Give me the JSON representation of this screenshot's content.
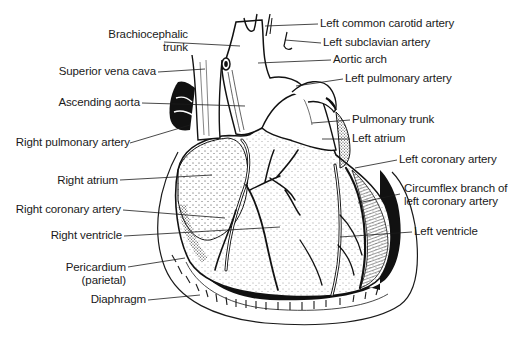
{
  "diagram": {
    "labels_left": [
      {
        "id": "brachiocephalic-trunk",
        "lines": [
          "Brachiocephalic",
          "trunk"
        ]
      },
      {
        "id": "superior-vena-cava",
        "lines": [
          "Superior vena cava"
        ]
      },
      {
        "id": "ascending-aorta",
        "lines": [
          "Ascending aorta"
        ]
      },
      {
        "id": "right-pulmonary-artery",
        "lines": [
          "Right pulmonary artery"
        ]
      },
      {
        "id": "right-atrium",
        "lines": [
          "Right atrium"
        ]
      },
      {
        "id": "right-coronary-artery",
        "lines": [
          "Right coronary artery"
        ]
      },
      {
        "id": "right-ventricle",
        "lines": [
          "Right ventricle"
        ]
      },
      {
        "id": "pericardium",
        "lines": [
          "Pericardium",
          "(parietal)"
        ]
      },
      {
        "id": "diaphragm",
        "lines": [
          "Diaphragm"
        ]
      }
    ],
    "labels_right": [
      {
        "id": "left-common-carotid-artery",
        "lines": [
          "Left common carotid artery"
        ]
      },
      {
        "id": "left-subclavian-artery",
        "lines": [
          "Left subclavian artery"
        ]
      },
      {
        "id": "aortic-arch",
        "lines": [
          "Aortic arch"
        ]
      },
      {
        "id": "left-pulmonary-artery",
        "lines": [
          "Left pulmonary artery"
        ]
      },
      {
        "id": "pulmonary-trunk",
        "lines": [
          "Pulmonary trunk"
        ]
      },
      {
        "id": "left-atrium",
        "lines": [
          "Left atrium"
        ]
      },
      {
        "id": "left-coronary-artery",
        "lines": [
          "Left coronary artery"
        ]
      },
      {
        "id": "circumflex-branch",
        "lines": [
          "Circumflex branch of",
          "left coronary artery"
        ]
      },
      {
        "id": "left-ventricle",
        "lines": [
          "Left ventricle"
        ]
      }
    ],
    "colors": {
      "ink": "#1a1a1a",
      "background": "#ffffff"
    }
  }
}
